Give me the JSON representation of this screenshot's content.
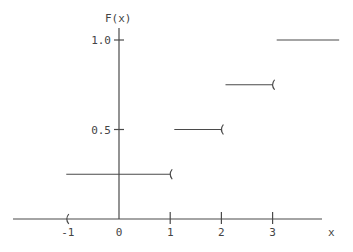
{
  "chart_data": {
    "type": "line",
    "subtype": "step-cdf",
    "title": "",
    "xlabel": "x",
    "ylabel": "F(x)",
    "x_ticks": [
      {
        "value": -1,
        "label": "-1"
      },
      {
        "value": 0,
        "label": "0"
      },
      {
        "value": 1,
        "label": "1"
      },
      {
        "value": 2,
        "label": "2"
      },
      {
        "value": 3,
        "label": "3"
      }
    ],
    "y_ticks": [
      {
        "value": 0.5,
        "label": "0.5"
      },
      {
        "value": 1.0,
        "label": "1.0"
      }
    ],
    "xlim": [
      -2.05,
      4.3
    ],
    "ylim": [
      0,
      1.12
    ],
    "grid": false,
    "legend": null,
    "steps": [
      {
        "from": -1.03,
        "to": 1,
        "value": 0.25,
        "right_open": true
      },
      {
        "from": 1.08,
        "to": 2,
        "value": 0.5,
        "right_open": true
      },
      {
        "from": 2.08,
        "to": 3,
        "value": 0.75,
        "right_open": true
      },
      {
        "from": 3.08,
        "to": 4.3,
        "value": 1.0,
        "right_open": false
      }
    ],
    "zero_segment": {
      "from": -2.05,
      "to": -1,
      "value": 0,
      "right_open": true
    },
    "line_color": "#4a4a4a"
  },
  "labels": {
    "y_axis": "F(x)",
    "x_axis": "x"
  }
}
